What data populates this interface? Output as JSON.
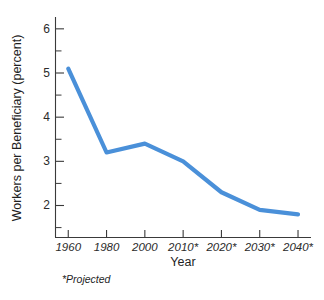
{
  "chart_data": {
    "type": "line",
    "title": "",
    "subtitle": "",
    "xlabel": "Year",
    "ylabel": "Workers per Beneficiary (percent)",
    "categories": [
      "1960",
      "1980",
      "2000",
      "2010*",
      "2020*",
      "2030*",
      "2040*"
    ],
    "x": [
      1960,
      1980,
      2000,
      2010,
      2020,
      2030,
      2040
    ],
    "values": [
      5.1,
      3.2,
      3.4,
      3.0,
      2.3,
      1.9,
      1.8
    ],
    "series": [
      {
        "name": "Workers per Beneficiary",
        "values": [
          5.1,
          3.2,
          3.4,
          3.0,
          2.3,
          1.9,
          1.8
        ],
        "color": "#4a90d9"
      }
    ],
    "ylim": [
      1.4,
      6.2
    ],
    "y_major_ticks": [
      2,
      3,
      4,
      5,
      6
    ],
    "y_tick_labels": [
      "2",
      "3",
      "4",
      "5",
      "6"
    ],
    "y_minor_ticks": [
      1.5,
      2.5,
      3.5,
      4.5,
      5.5
    ],
    "grid": false,
    "legend": false,
    "legend_position": "none",
    "annotations": [
      {
        "name": "projected-footnote",
        "text": "*Projected"
      }
    ]
  },
  "axes": {
    "y_title": "Workers per Beneficiary (percent)",
    "x_title": "Year"
  },
  "footnote": {
    "text": "*Projected"
  },
  "colors": {
    "line": "#4a90d9",
    "axis": "#3a3a3a",
    "text": "#1f1f1f",
    "background": "#ffffff"
  }
}
